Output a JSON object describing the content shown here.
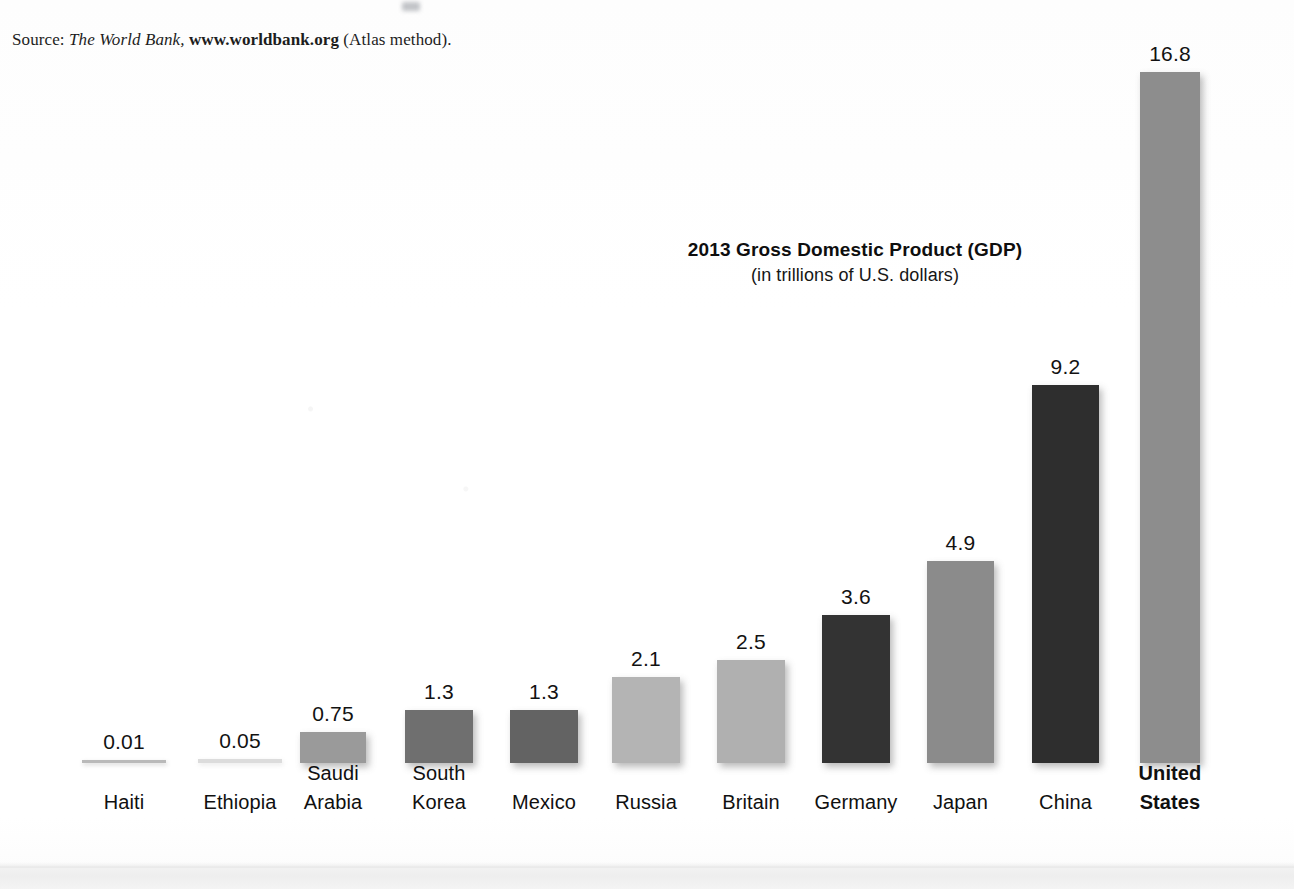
{
  "source_note": {
    "prefix": "Source:",
    "italic": "The World Bank,",
    "bold": "www.worldbank.org",
    "suffix": "(Atlas method)."
  },
  "chart_data": {
    "type": "bar",
    "title": "2013 Gross Domestic Product (GDP)",
    "subtitle": "(in trillions of U.S. dollars)",
    "xlabel": "",
    "ylabel": "",
    "unit": "trillions of U.S. dollars",
    "year": 2013,
    "ylim": [
      0,
      16.8
    ],
    "grid": false,
    "legend": "none",
    "categories": [
      "Haiti",
      "Ethiopia",
      "Saudi Arabia",
      "South Korea",
      "Mexico",
      "Russia",
      "Britain",
      "Germany",
      "Japan",
      "China",
      "United States"
    ],
    "values": [
      0.01,
      0.05,
      0.75,
      1.3,
      1.3,
      2.1,
      2.5,
      3.6,
      4.9,
      9.2,
      16.8
    ],
    "value_labels": [
      "0.01",
      "0.05",
      "0.75",
      "1.3",
      "1.3",
      "2.1",
      "2.5",
      "3.6",
      "4.9",
      "9.2",
      "16.8"
    ],
    "bars": [
      {
        "label_line1": "Haiti",
        "label_line2": "",
        "value": 0.01,
        "value_label": "0.01",
        "color": "#b9b9b9",
        "emphasis": false
      },
      {
        "label_line1": "Ethiopia",
        "label_line2": "",
        "value": 0.05,
        "value_label": "0.05",
        "color": "#dcdcdc",
        "emphasis": false
      },
      {
        "label_line1": "Saudi",
        "label_line2": "Arabia",
        "value": 0.75,
        "value_label": "0.75",
        "color": "#9a9a9a",
        "emphasis": false
      },
      {
        "label_line1": "South",
        "label_line2": "Korea",
        "value": 1.3,
        "value_label": "1.3",
        "color": "#6f6f6f",
        "emphasis": false
      },
      {
        "label_line1": "Mexico",
        "label_line2": "",
        "value": 1.3,
        "value_label": "1.3",
        "color": "#636363",
        "emphasis": false
      },
      {
        "label_line1": "Russia",
        "label_line2": "",
        "value": 2.1,
        "value_label": "2.1",
        "color": "#b4b4b4",
        "emphasis": false
      },
      {
        "label_line1": "Britain",
        "label_line2": "",
        "value": 2.5,
        "value_label": "2.5",
        "color": "#b0b0b0",
        "emphasis": false
      },
      {
        "label_line1": "Germany",
        "label_line2": "",
        "value": 3.6,
        "value_label": "3.6",
        "color": "#333333",
        "emphasis": false
      },
      {
        "label_line1": "Japan",
        "label_line2": "",
        "value": 4.9,
        "value_label": "4.9",
        "color": "#8b8b8b",
        "emphasis": false
      },
      {
        "label_line1": "China",
        "label_line2": "",
        "value": 9.2,
        "value_label": "9.2",
        "color": "#2e2e2e",
        "emphasis": false
      },
      {
        "label_line1": "United",
        "label_line2": "States",
        "value": 16.8,
        "value_label": "16.8",
        "color": "#8d8d8d",
        "emphasis": true
      }
    ]
  }
}
